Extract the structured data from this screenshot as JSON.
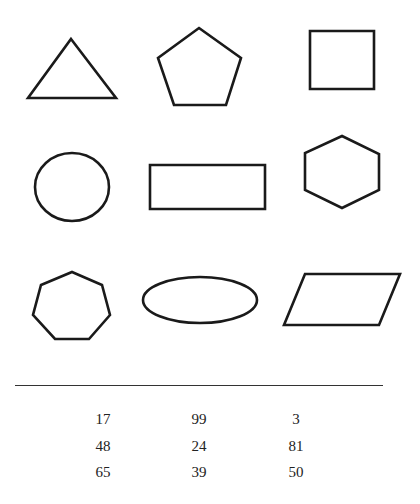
{
  "shapes": [
    {
      "name": "triangle",
      "type": "polygon",
      "points": "71,39 116,98 28,98"
    },
    {
      "name": "pentagon",
      "type": "polygon",
      "points": "199,28 241,58 226,105 174,105 158,58"
    },
    {
      "name": "square",
      "type": "polygon",
      "points": "310,31 374,31 374,89 310,89"
    },
    {
      "name": "circle",
      "type": "ellipse",
      "cx": 72,
      "cy": 187,
      "rx": 37,
      "ry": 34
    },
    {
      "name": "rectangle",
      "type": "polygon",
      "points": "150,165 265,165 265,209 150,209"
    },
    {
      "name": "hexagon",
      "type": "polygon",
      "points": "342,136 379,154 379,190 342,208 305,190 305,153"
    },
    {
      "name": "heptagon",
      "type": "polygon",
      "points": "72,272 102,285 110,315 89,339 55,339 33,315 41,285"
    },
    {
      "name": "ellipse",
      "type": "ellipse",
      "cx": 200,
      "cy": 300,
      "rx": 57,
      "ry": 23
    },
    {
      "name": "parallelogram",
      "type": "polygon",
      "points": "305,274 400,274 379,325 284,325"
    }
  ],
  "numbers": {
    "rows": [
      [
        "17",
        "99",
        "3"
      ],
      [
        "48",
        "24",
        "81"
      ],
      [
        "65",
        "39",
        "50"
      ]
    ]
  }
}
